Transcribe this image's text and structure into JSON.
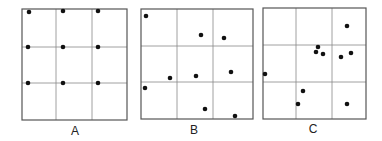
{
  "panels": [
    {
      "label": "A",
      "box": {
        "x": 22,
        "y": 9,
        "w": 105,
        "h": 111
      },
      "grid_x": [
        56,
        92
      ],
      "grid_y": [
        47,
        83
      ],
      "label_pos": {
        "x": 75,
        "y": 124
      },
      "points": [
        [
          29,
          12
        ],
        [
          63,
          11
        ],
        [
          98,
          11
        ],
        [
          28,
          47
        ],
        [
          63,
          47
        ],
        [
          98,
          47
        ],
        [
          28,
          83
        ],
        [
          63,
          83
        ],
        [
          98,
          83
        ]
      ]
    },
    {
      "label": "B",
      "box": {
        "x": 141,
        "y": 9,
        "w": 112,
        "h": 110
      },
      "grid_x": [
        177,
        213
      ],
      "grid_y": [
        46,
        82
      ],
      "label_pos": {
        "x": 194,
        "y": 123
      },
      "points": [
        [
          146,
          16
        ],
        [
          201,
          35
        ],
        [
          224,
          38
        ],
        [
          170,
          78
        ],
        [
          196,
          76
        ],
        [
          231,
          72
        ],
        [
          145,
          88
        ],
        [
          205,
          109
        ],
        [
          235,
          116
        ]
      ]
    },
    {
      "label": "C",
      "box": {
        "x": 263,
        "y": 8,
        "w": 103,
        "h": 111
      },
      "grid_x": [
        296,
        332
      ],
      "grid_y": [
        45,
        82
      ],
      "label_pos": {
        "x": 313,
        "y": 122
      },
      "points": [
        [
          347,
          26
        ],
        [
          318,
          47
        ],
        [
          316,
          52
        ],
        [
          323,
          54
        ],
        [
          341,
          57
        ],
        [
          351,
          53
        ],
        [
          265,
          74
        ],
        [
          303,
          91
        ],
        [
          298,
          104
        ],
        [
          347,
          104
        ]
      ]
    }
  ],
  "colors": {
    "border": "#555555",
    "grid": "#888888",
    "point": "#111111"
  }
}
